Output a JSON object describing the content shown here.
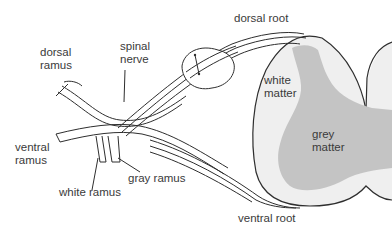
{
  "diagram": {
    "type": "anatomy-cross-section",
    "colors": {
      "background": "#ffffff",
      "outline": "#2e2e2e",
      "white_matter": "#efefef",
      "grey_matter": "#c4c4c4",
      "text": "#3a3a3a"
    },
    "labels": {
      "dorsal_root": "dorsal root",
      "spinal_nerve": "spinal\nnerve",
      "dorsal_ramus": "dorsal\nramus",
      "ventral_ramus": "ventral\nramus",
      "white_ramus": "white ramus",
      "gray_ramus": "gray ramus",
      "white_matter": "white\nmatter",
      "grey_matter": "grey\nmatter",
      "ventral_root": "ventral root"
    }
  }
}
